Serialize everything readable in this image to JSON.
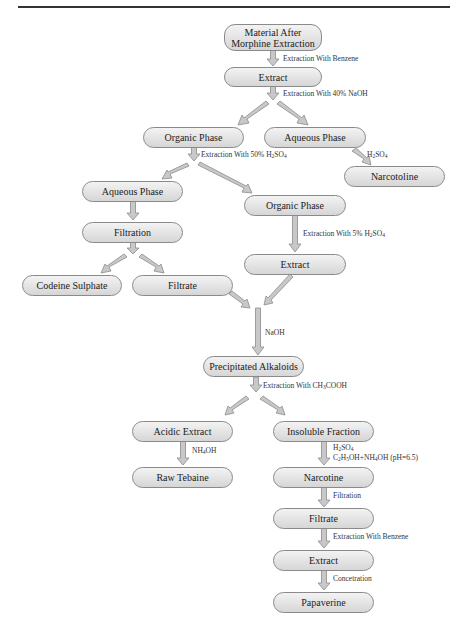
{
  "diagram": {
    "type": "flowchart",
    "title": "",
    "nodes": [
      {
        "id": "material",
        "label": "Material After Morphine Extraction",
        "line1": "Material After",
        "line2": "Morphine Extraction"
      },
      {
        "id": "extract1",
        "label": "Extract"
      },
      {
        "id": "organic1",
        "label": "Organic Phase"
      },
      {
        "id": "aqueous1",
        "label": "Aqueous Phase"
      },
      {
        "id": "narcotoline",
        "label": "Narcotoline"
      },
      {
        "id": "aqueous2",
        "label": "Aqueous Phase"
      },
      {
        "id": "organic2",
        "label": "Organic Phase"
      },
      {
        "id": "filtration",
        "label": "Filtration"
      },
      {
        "id": "extract2",
        "label": "Extract"
      },
      {
        "id": "codeine",
        "label": "Codeine Sulphate"
      },
      {
        "id": "filtrate1",
        "label": "Filtrate"
      },
      {
        "id": "precip",
        "label": "Precipitated Alkaloids"
      },
      {
        "id": "acidic",
        "label": "Acidic Extract"
      },
      {
        "id": "insoluble",
        "label": "Insoluble Fraction"
      },
      {
        "id": "tebaine",
        "label": "Raw Tebaine"
      },
      {
        "id": "narcotine",
        "label": "Narcotine"
      },
      {
        "id": "filtrate2",
        "label": "Filtrate"
      },
      {
        "id": "extract3",
        "label": "Extract"
      },
      {
        "id": "papaverine",
        "label": "Papaverine"
      }
    ],
    "edges": [
      {
        "from": "material",
        "to": "extract1",
        "label": "Extraction With Benzene"
      },
      {
        "from": "extract1",
        "to": "organic1",
        "label": "Extraction With 40% NaOH"
      },
      {
        "from": "extract1",
        "to": "aqueous1",
        "label": ""
      },
      {
        "from": "aqueous1",
        "to": "narcotoline",
        "label": "H2SO4"
      },
      {
        "from": "organic1",
        "to": "aqueous2",
        "label": "Extraction With 50% H2SO4"
      },
      {
        "from": "organic1",
        "to": "organic2",
        "label": ""
      },
      {
        "from": "aqueous2",
        "to": "filtration",
        "label": ""
      },
      {
        "from": "organic2",
        "to": "extract2",
        "label": "Extraction With 5% H2SO4"
      },
      {
        "from": "filtration",
        "to": "codeine",
        "label": ""
      },
      {
        "from": "filtration",
        "to": "filtrate1",
        "label": ""
      },
      {
        "from": "filtrate1",
        "to": "precip",
        "label": "NaOH"
      },
      {
        "from": "extract2",
        "to": "precip",
        "label": ""
      },
      {
        "from": "precip",
        "to": "acidic",
        "label": "Extraction With CH3COOH"
      },
      {
        "from": "precip",
        "to": "insoluble",
        "label": ""
      },
      {
        "from": "acidic",
        "to": "tebaine",
        "label": "NH4OH"
      },
      {
        "from": "insoluble",
        "to": "narcotine",
        "label": "H2SO4 / C2H5OH+NH4OH (pH=6.5)"
      },
      {
        "from": "narcotine",
        "to": "filtrate2",
        "label": "Filtration"
      },
      {
        "from": "filtrate2",
        "to": "extract3",
        "label": "Extraction With Benzene"
      },
      {
        "from": "extract3",
        "to": "papaverine",
        "label": "Concetration"
      }
    ],
    "edge_labels": {
      "benzene1": "Extraction With Benzene",
      "naoh40_pre": "Extraction With 40% NaOH",
      "h2so4_50_pre": "Extraction With 50% H",
      "h2so4_5_pre": "Extraction With 5% H",
      "h2so4_short_pre": "H",
      "naoh": "NaOH",
      "acetic_pre": "Extraction With CH",
      "acetic_post": "COOH",
      "nh4oh_pre": "NH",
      "nh4oh_post": "OH",
      "insol_line1_pre": "H",
      "insol_line2_a": "C",
      "insol_line2_b": "H",
      "insol_line2_c": "OH+NH",
      "insol_line2_d": "OH (pH=6.5)",
      "filtration": "Filtration",
      "benzene2": "Extraction With Benzene",
      "concentration": "Concetration",
      "so": "SO",
      "sub2": "2",
      "sub3": "3",
      "sub4": "4",
      "sub5": "5"
    },
    "colors": {
      "node_fill_top": "#f3f3f3",
      "node_fill_bottom": "#d6d6d6",
      "node_border": "#8a8a8a",
      "arrow_fill": "#c8c8c8",
      "arrow_stroke": "#8c8c8c",
      "rule": "#333333"
    }
  }
}
